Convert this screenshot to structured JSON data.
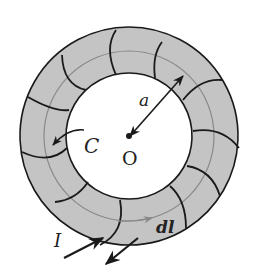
{
  "diagram": {
    "labels": {
      "radius": "a",
      "center": "O",
      "contour": "C",
      "line_element": "dl",
      "current": "I"
    },
    "colors": {
      "ring_fill": "#c4c4c4",
      "winding": "#1a1a1a",
      "contour": "#8a8a8a",
      "background": "#ffffff"
    },
    "geometry": {
      "center": [
        129,
        136
      ],
      "outer_radius": 109,
      "inner_radius": 63,
      "contour_radius": 85,
      "winding_count": 12
    }
  }
}
